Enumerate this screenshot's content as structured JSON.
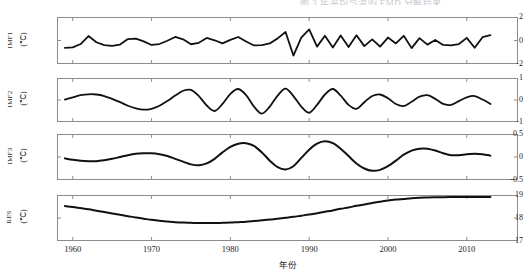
{
  "figure": {
    "cut_caption": "图 3  年平均气温的 EMD 分解结果",
    "line_color": "#111111",
    "frame_color": "#8c8c8c",
    "background": "#ffffff",
    "x_axis_label": "年份",
    "x_ticks": [
      "1960",
      "1970",
      "1980",
      "1990",
      "2000",
      "2010"
    ],
    "x_tick_values": [
      1960,
      1970,
      1980,
      1990,
      2000,
      2010
    ],
    "xlim": [
      1958,
      2016.5
    ],
    "unit_label": "(℃)"
  },
  "chart_data": {
    "type": "line",
    "title": "图 3  年平均气温的 EMD 分解结果",
    "xlabel": "年份",
    "ylabel": "",
    "grid": false,
    "legend": "none",
    "xlim": [
      1958,
      2016.5
    ],
    "x": [
      1959,
      1960,
      1961,
      1962,
      1963,
      1964,
      1965,
      1966,
      1967,
      1968,
      1969,
      1970,
      1971,
      1972,
      1973,
      1974,
      1975,
      1976,
      1977,
      1978,
      1979,
      1980,
      1981,
      1982,
      1983,
      1984,
      1985,
      1986,
      1987,
      1988,
      1989,
      1990,
      1991,
      1992,
      1993,
      1994,
      1995,
      1996,
      1997,
      1998,
      1999,
      2000,
      2001,
      2002,
      2003,
      2004,
      2005,
      2006,
      2007,
      2008,
      2009,
      2010,
      2011,
      2012,
      2013
    ],
    "panels": [
      {
        "name": "IMF1",
        "ylabel": "IMF1",
        "unit": "(℃)",
        "ylim": [
          -2,
          2
        ],
        "y_ticks": [
          -2,
          0,
          2
        ],
        "y_tick_labels": [
          "-2",
          "0",
          "2"
        ],
        "values": [
          -0.62,
          -0.58,
          -0.3,
          0.38,
          -0.15,
          -0.4,
          -0.45,
          -0.35,
          0.12,
          0.16,
          -0.08,
          -0.38,
          -0.3,
          -0.02,
          0.3,
          0.1,
          -0.32,
          -0.2,
          0.22,
          0.02,
          -0.25,
          0.05,
          0.3,
          -0.08,
          -0.42,
          -0.4,
          -0.25,
          0.18,
          0.72,
          -1.28,
          0.25,
          0.95,
          -0.52,
          0.4,
          -0.6,
          0.42,
          -0.55,
          0.45,
          -0.48,
          0.1,
          -0.52,
          0.25,
          -0.25,
          0.4,
          -0.65,
          0.2,
          -0.35,
          0.05,
          -0.38,
          -0.42,
          -0.3,
          0.22,
          -0.62,
          0.28,
          0.45
        ]
      },
      {
        "name": "IMF2",
        "ylabel": "IMF2",
        "unit": "(℃)",
        "ylim": [
          -1,
          1
        ],
        "y_ticks": [
          -1,
          0,
          1
        ],
        "y_tick_labels": [
          "-1",
          "0",
          "1"
        ],
        "values": [
          0.02,
          0.12,
          0.22,
          0.26,
          0.25,
          0.18,
          0.05,
          -0.1,
          -0.26,
          -0.38,
          -0.44,
          -0.4,
          -0.26,
          -0.05,
          0.2,
          0.42,
          0.46,
          0.18,
          -0.25,
          -0.5,
          -0.18,
          0.28,
          0.5,
          0.22,
          -0.3,
          -0.62,
          -0.3,
          0.2,
          0.52,
          0.18,
          -0.3,
          -0.58,
          -0.22,
          0.25,
          0.5,
          0.2,
          -0.22,
          -0.4,
          -0.1,
          0.18,
          0.25,
          0.08,
          -0.18,
          -0.28,
          -0.08,
          0.15,
          0.22,
          0.05,
          -0.18,
          -0.22,
          -0.05,
          0.12,
          0.18,
          0.02,
          -0.18
        ]
      },
      {
        "name": "IMF3",
        "ylabel": "IMF3",
        "unit": "(℃)",
        "ylim": [
          -0.5,
          0.5
        ],
        "y_ticks": [
          -0.5,
          0,
          0.5
        ],
        "y_tick_labels": [
          "-0.5",
          "0",
          "0.5"
        ],
        "values": [
          -0.03,
          -0.06,
          -0.08,
          -0.09,
          -0.09,
          -0.07,
          -0.04,
          0.0,
          0.04,
          0.07,
          0.08,
          0.08,
          0.06,
          0.02,
          -0.04,
          -0.1,
          -0.16,
          -0.18,
          -0.14,
          -0.04,
          0.1,
          0.22,
          0.29,
          0.3,
          0.24,
          0.1,
          -0.08,
          -0.22,
          -0.27,
          -0.2,
          -0.02,
          0.16,
          0.29,
          0.34,
          0.3,
          0.18,
          0.02,
          -0.14,
          -0.25,
          -0.3,
          -0.28,
          -0.2,
          -0.08,
          0.05,
          0.14,
          0.18,
          0.18,
          0.14,
          0.08,
          0.04,
          0.04,
          0.06,
          0.07,
          0.06,
          0.03
        ]
      },
      {
        "name": "RES",
        "ylabel": "RES",
        "unit": "(℃)",
        "ylim": [
          17,
          19
        ],
        "y_ticks": [
          17,
          18,
          19
        ],
        "y_tick_labels": [
          "17",
          "18",
          "19"
        ],
        "values": [
          18.52,
          18.48,
          18.43,
          18.38,
          18.32,
          18.26,
          18.2,
          18.14,
          18.08,
          18.02,
          17.97,
          17.92,
          17.88,
          17.85,
          17.82,
          17.8,
          17.79,
          17.78,
          17.78,
          17.78,
          17.79,
          17.8,
          17.82,
          17.84,
          17.87,
          17.9,
          17.93,
          17.97,
          18.01,
          18.05,
          18.1,
          18.15,
          18.21,
          18.27,
          18.33,
          18.4,
          18.46,
          18.53,
          18.59,
          18.65,
          18.71,
          18.76,
          18.8,
          18.83,
          18.86,
          18.88,
          18.89,
          18.9,
          18.905,
          18.91,
          18.91,
          18.91,
          18.91,
          18.91,
          18.91
        ]
      }
    ]
  }
}
